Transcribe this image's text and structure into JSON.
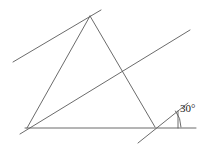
{
  "figure": {
    "type": "geometry-diagram",
    "stroke_color": "#5a5a5a",
    "background_color": "#ffffff",
    "canvas": {
      "width": 208,
      "height": 148
    },
    "labels": {
      "angle_30": "30°"
    },
    "label_positions": {
      "angle_30": {
        "x": 180,
        "y": 110
      }
    },
    "points": {
      "apex": {
        "x": 90,
        "y": 16
      },
      "bottom_left": {
        "x": 27,
        "y": 128
      },
      "bottom_right": {
        "x": 155,
        "y": 127
      },
      "base_left_end": {
        "x": 25,
        "y": 128
      },
      "base_right_end": {
        "x": 196,
        "y": 128
      },
      "upper_line_start": {
        "x": 13,
        "y": 62
      },
      "upper_line_end": {
        "x": 101,
        "y": 10
      },
      "long_line_start": {
        "x": 20,
        "y": 134
      },
      "long_line_end": {
        "x": 190,
        "y": 30
      },
      "short_line_start": {
        "x": 138,
        "y": 143
      },
      "short_line_end": {
        "x": 188,
        "y": 103
      },
      "tick_top": {
        "x": 178,
        "y": 111
      },
      "tick_bottom": {
        "x": 178,
        "y": 128
      }
    },
    "segments": [
      {
        "name": "triangle-left-side",
        "from": "bottom_left",
        "to": "apex"
      },
      {
        "name": "triangle-right-side",
        "from": "apex",
        "to": "bottom_right"
      },
      {
        "name": "triangle-base",
        "from": "base_left_end",
        "to": "base_right_end"
      },
      {
        "name": "upper-transversal",
        "from": "upper_line_start",
        "to": "upper_line_end"
      },
      {
        "name": "long-transversal",
        "from": "long_line_start",
        "to": "long_line_end"
      },
      {
        "name": "short-transversal",
        "from": "short_line_start",
        "to": "short_line_end"
      },
      {
        "name": "angle-tick-mark",
        "from": "tick_top",
        "to": "tick_bottom"
      }
    ],
    "angle_arc": {
      "name": "angle-arc-30",
      "center": {
        "x": 155,
        "y": 127
      },
      "radius": 26,
      "start_angle_deg": 0,
      "end_angle_deg": 38
    }
  }
}
